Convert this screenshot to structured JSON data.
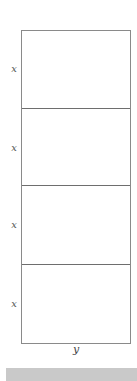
{
  "diagram": {
    "rows": [
      {
        "label": "x"
      },
      {
        "label": "x"
      },
      {
        "label": "x"
      },
      {
        "label": "x"
      }
    ],
    "column_label": "y",
    "colors": {
      "border": "#8a8a8a",
      "divider": "#6e6e6e",
      "label": "#555555",
      "footer_bar": "#c9c9c9"
    }
  }
}
